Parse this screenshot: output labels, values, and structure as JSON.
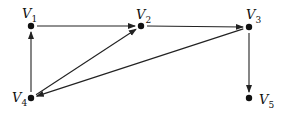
{
  "graph": {
    "type": "directed",
    "nodes": [
      {
        "id": "V1",
        "label": "V",
        "sub": "1",
        "x": 31,
        "y": 26,
        "lx": 22,
        "ly": 7
      },
      {
        "id": "V2",
        "label": "V",
        "sub": "2",
        "x": 141,
        "y": 26,
        "lx": 136,
        "ly": 8
      },
      {
        "id": "V3",
        "label": "V",
        "sub": "3",
        "x": 249,
        "y": 27,
        "lx": 246,
        "ly": 8
      },
      {
        "id": "V4",
        "label": "V",
        "sub": "4",
        "x": 31,
        "y": 98,
        "lx": 12,
        "ly": 91
      },
      {
        "id": "V5",
        "label": "V",
        "sub": "5",
        "x": 249,
        "y": 98,
        "lx": 259,
        "ly": 93
      }
    ],
    "edges": [
      {
        "from": "V1",
        "to": "V2"
      },
      {
        "from": "V2",
        "to": "V3"
      },
      {
        "from": "V3",
        "to": "V5"
      },
      {
        "from": "V4",
        "to": "V1"
      },
      {
        "from": "V4",
        "to": "V2"
      },
      {
        "from": "V3",
        "to": "V4"
      }
    ],
    "colors": {
      "stroke": "#222222",
      "node": "#111111"
    }
  }
}
